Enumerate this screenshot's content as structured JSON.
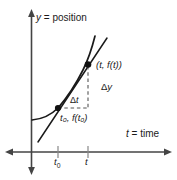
{
  "figure": {
    "background_color": "#ffffff",
    "ink_color": "#1a1a1a",
    "axes": {
      "y_axis_label": "y = position",
      "y_axis_label_variable": "y",
      "y_axis_label_text": "= position",
      "x_axis_label": "t = time",
      "x_axis_label_variable": "t",
      "x_axis_label_text": "= time",
      "x_ticks": [
        {
          "name": "t-sub-0",
          "label_variable": "t",
          "label_sub": "0"
        },
        {
          "name": "t",
          "label_variable": "t",
          "label_sub": ""
        }
      ]
    },
    "annotations": {
      "point_upper_label": "(t, f(t))",
      "point_lower_label": "t₀, f(t₀)",
      "delta_y_label": "Δy",
      "delta_t_label": "Δt",
      "delta_y_symbol": "Δ",
      "delta_y_variable": "y",
      "delta_t_symbol": "Δ",
      "delta_t_variable": "t"
    },
    "elements": [
      {
        "name": "position-curve",
        "type": "curve"
      },
      {
        "name": "secant-line",
        "type": "line"
      },
      {
        "name": "point-t0",
        "type": "marker"
      },
      {
        "name": "point-t",
        "type": "marker"
      },
      {
        "name": "delta-y-dashed-line",
        "type": "dashed"
      },
      {
        "name": "delta-t-dashed-line",
        "type": "dashed"
      }
    ]
  }
}
